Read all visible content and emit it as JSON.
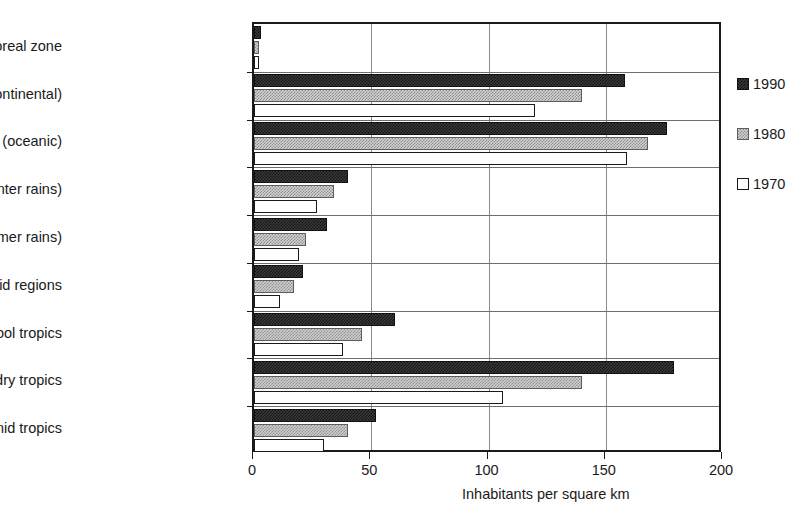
{
  "chart_data": {
    "type": "bar",
    "orientation": "horizontal",
    "title": "",
    "xlabel": "Inhabitants per square km",
    "ylabel": "",
    "xlim": [
      0,
      200
    ],
    "xticks": [
      0,
      50,
      100,
      150,
      200
    ],
    "xtick_labels": [
      "0",
      "50",
      "100",
      "150",
      "200"
    ],
    "grid": "vertical gridlines at 50, 100, 150",
    "legend_position": "right",
    "categories": [
      "Boreal zone",
      "Temperate zone (continental)",
      "Temperate zone (oceanic)",
      "Subtropics (winter rains)",
      "Subtropics (summer rains)",
      "Arid regions",
      "Cool tropics",
      "Warm seasonally dry tropics",
      "Warm humid tropics"
    ],
    "series": [
      {
        "name": "1990",
        "color": "#3a3a3a",
        "values": [
          3,
          158,
          176,
          40,
          31,
          21,
          60,
          179,
          52
        ]
      },
      {
        "name": "1980",
        "color": "#d2d2d2",
        "values": [
          2,
          140,
          168,
          34,
          22,
          17,
          46,
          140,
          40
        ]
      },
      {
        "name": "1970",
        "color": "#ffffff",
        "values": [
          2,
          120,
          159,
          27,
          19,
          11,
          38,
          106,
          30
        ]
      }
    ]
  },
  "legend": {
    "items": [
      {
        "label": "1990",
        "swatch": "dark-checkered-swatch"
      },
      {
        "label": "1980",
        "swatch": "gray-checkered-swatch"
      },
      {
        "label": "1970",
        "swatch": "white-outline-swatch"
      }
    ]
  },
  "axis": {
    "x_title": "Inhabitants per square km"
  }
}
